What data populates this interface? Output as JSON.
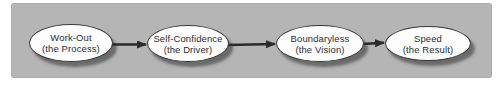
{
  "diagram": {
    "type": "flowchart",
    "direction": "left-to-right",
    "nodes": [
      {
        "title": "Work-Out",
        "subtitle": "(the Process)"
      },
      {
        "title": "Self-Confidence",
        "subtitle": "(the Driver)"
      },
      {
        "title": "Boundaryless",
        "subtitle": "(the Vision)"
      },
      {
        "title": "Speed",
        "subtitle": "(the Result)"
      }
    ],
    "connectors": [
      {
        "from": "Work-Out",
        "to": "Self-Confidence",
        "style": "solid-arrow"
      },
      {
        "from": "Self-Confidence",
        "to": "Boundaryless",
        "style": "solid-arrow"
      },
      {
        "from": "Boundaryless",
        "to": "Speed",
        "style": "solid-arrow"
      }
    ],
    "colors": {
      "panel_background": "#b5b5b5",
      "node_fill": "#fdfdfd",
      "node_border": "#383838",
      "node_shadow": "#5c5c5c",
      "arrow": "#2b2b2b",
      "text": "#2d2d2d",
      "page_background": "#ffffff"
    }
  }
}
